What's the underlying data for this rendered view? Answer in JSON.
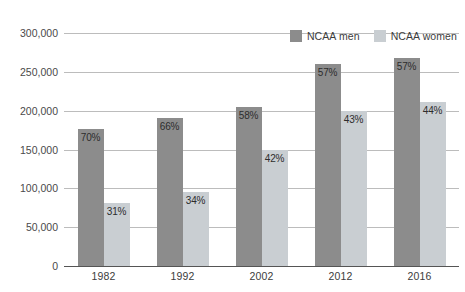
{
  "chart_data": {
    "type": "bar",
    "title": "",
    "xlabel": "",
    "ylabel": "",
    "grid": true,
    "legend_position": "top-right",
    "categories": [
      "1982",
      "1992",
      "2002",
      "2012",
      "2016"
    ],
    "ylim": [
      0,
      300000
    ],
    "yticks": [
      0,
      50000,
      100000,
      150000,
      200000,
      250000,
      300000
    ],
    "ytick_labels": [
      "0",
      "50,000",
      "100,000",
      "150,000",
      "200,000",
      "250,000",
      "300,000"
    ],
    "series": [
      {
        "name": "NCAA men",
        "color": "#8c8c8c",
        "values": [
          176000,
          190000,
          205000,
          260000,
          268000
        ],
        "data_labels": [
          "70%",
          "66%",
          "58%",
          "57%",
          "57%"
        ]
      },
      {
        "name": "NCAA women",
        "color": "#c9ced2",
        "values": [
          81000,
          95000,
          150000,
          200000,
          211000
        ],
        "data_labels": [
          "31%",
          "34%",
          "42%",
          "43%",
          "44%"
        ]
      }
    ]
  },
  "legend": {
    "entries": [
      {
        "label": "NCAA men",
        "color": "#8c8c8c"
      },
      {
        "label": "NCAA women",
        "color": "#c9ced2"
      }
    ]
  }
}
